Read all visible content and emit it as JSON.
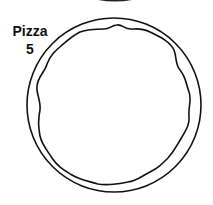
{
  "item": {
    "name": "Pizza",
    "count": "5"
  },
  "colors": {
    "stroke": "#111111",
    "background": "#ffffff"
  }
}
